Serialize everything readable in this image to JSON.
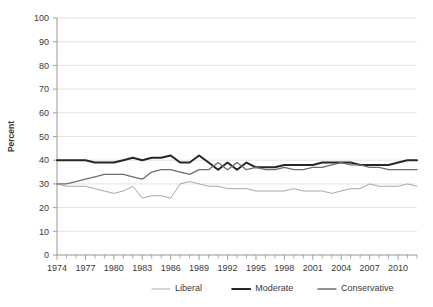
{
  "chart_data": {
    "type": "line",
    "title": "",
    "xlabel": "",
    "ylabel": "Percent",
    "ylim": [
      0,
      100
    ],
    "xlim": [
      1974,
      2012
    ],
    "ytick_step": 10,
    "yticks": [
      0,
      10,
      20,
      30,
      40,
      50,
      60,
      70,
      80,
      90,
      100
    ],
    "xticks_labeled": [
      1974,
      1977,
      1980,
      1983,
      1986,
      1989,
      1992,
      1995,
      1998,
      2001,
      2004,
      2007,
      2010
    ],
    "x": [
      1974,
      1975,
      1976,
      1977,
      1978,
      1979,
      1980,
      1981,
      1982,
      1983,
      1984,
      1985,
      1986,
      1987,
      1988,
      1989,
      1990,
      1991,
      1992,
      1993,
      1994,
      1995,
      1996,
      1997,
      1998,
      1999,
      2000,
      2001,
      2002,
      2003,
      2004,
      2005,
      2006,
      2007,
      2008,
      2009,
      2010,
      2011,
      2012
    ],
    "grid": true,
    "legend_position": "bottom",
    "series": [
      {
        "name": "Liberal",
        "color": "#a8a8a8",
        "width": 1.0,
        "values": [
          30,
          29,
          29,
          29,
          28,
          27,
          26,
          27,
          29,
          24,
          25,
          25,
          24,
          30,
          31,
          30,
          29,
          29,
          28,
          28,
          28,
          27,
          27,
          27,
          27,
          28,
          27,
          27,
          27,
          26,
          27,
          28,
          28,
          30,
          29,
          29,
          29,
          30,
          29
        ]
      },
      {
        "name": "Moderate",
        "color": "#262626",
        "width": 2.0,
        "values": [
          40,
          40,
          40,
          40,
          39,
          39,
          39,
          40,
          41,
          40,
          41,
          41,
          42,
          39,
          39,
          42,
          39,
          36,
          39,
          36,
          39,
          37,
          37,
          37,
          38,
          38,
          38,
          38,
          39,
          39,
          39,
          39,
          38,
          38,
          38,
          38,
          39,
          40,
          40
        ]
      },
      {
        "name": "Conservative",
        "color": "#6e6e6e",
        "width": 1.3,
        "values": [
          30,
          30,
          31,
          32,
          33,
          34,
          34,
          34,
          33,
          32,
          35,
          36,
          36,
          35,
          34,
          36,
          36,
          39,
          36,
          39,
          36,
          37,
          36,
          36,
          37,
          36,
          36,
          37,
          37,
          38,
          39,
          38,
          38,
          37,
          37,
          36,
          36,
          36,
          36
        ]
      }
    ]
  },
  "legend": {
    "items": [
      {
        "label": "Liberal",
        "color": "#a8a8a8"
      },
      {
        "label": "Moderate",
        "color": "#262626"
      },
      {
        "label": "Conservative",
        "color": "#6e6e6e"
      }
    ]
  },
  "axis": {
    "y_title": "Percent"
  }
}
